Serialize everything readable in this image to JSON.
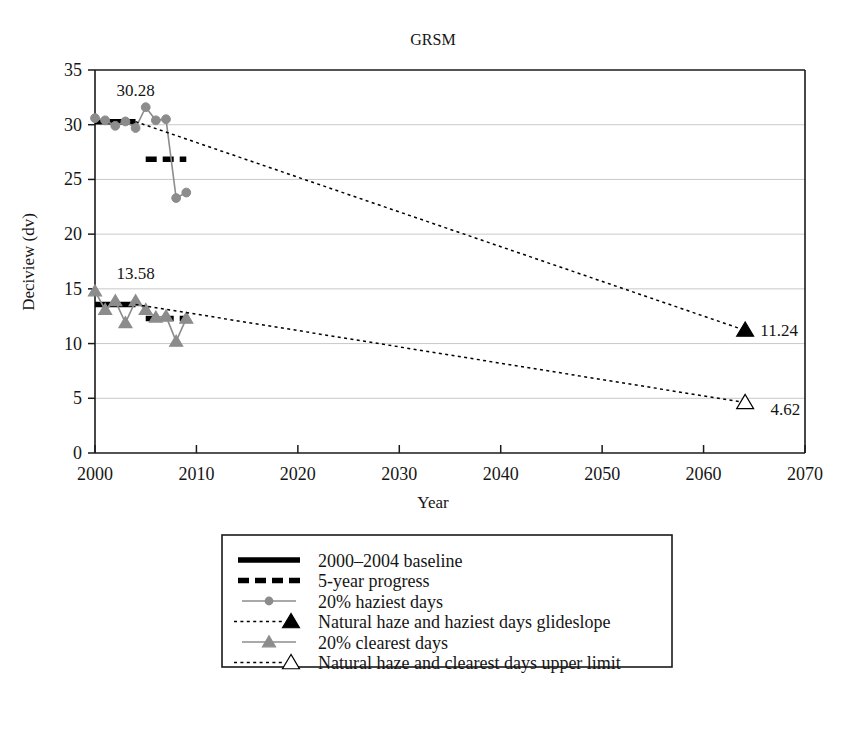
{
  "chart_data": {
    "type": "line",
    "title": "GRSM",
    "xlabel": "Year",
    "ylabel": "Deciview (dv)",
    "xlim": [
      2000,
      2070
    ],
    "ylim": [
      0,
      35
    ],
    "xticks": [
      "2000",
      "2010",
      "2020",
      "2030",
      "2040",
      "2050",
      "2060",
      "2070"
    ],
    "yticks": [
      "0",
      "5",
      "10",
      "15",
      "20",
      "25",
      "30",
      "35"
    ],
    "grid": "horizontal",
    "legend_position": "below-plot",
    "series": [
      {
        "name": "2000–2004 baseline",
        "style": "thick-solid-black",
        "color": "#000000",
        "x": [
          2000,
          2004
        ],
        "y": [
          30.28,
          30.28
        ],
        "label": "30.28"
      },
      {
        "name": "2000–2004 baseline (clearest)",
        "style": "thick-solid-black",
        "color": "#000000",
        "x": [
          2000,
          2004
        ],
        "y": [
          13.58,
          13.58
        ],
        "label": "13.58"
      },
      {
        "name": "5-year progress",
        "style": "thick-dashed-black",
        "color": "#000000",
        "x": [
          2005,
          2009
        ],
        "y": [
          26.85,
          26.85
        ]
      },
      {
        "name": "5-year progress (clearest)",
        "style": "thick-dashed-black",
        "color": "#000000",
        "x": [
          2005,
          2009
        ],
        "y": [
          12.3,
          12.3
        ]
      },
      {
        "name": "20% haziest days",
        "style": "line-circle-gray",
        "color": "#8c8c8c",
        "x": [
          2000,
          2001,
          2002,
          2003,
          2004,
          2005,
          2006,
          2007,
          2008,
          2009
        ],
        "y": [
          30.6,
          30.4,
          29.9,
          30.3,
          29.7,
          31.6,
          30.4,
          30.5,
          23.3,
          23.8
        ]
      },
      {
        "name": "Natural haze and haziest days glideslope",
        "style": "dotted-black-triangle-filled",
        "color": "#000000",
        "x": [
          2004,
          2064
        ],
        "y": [
          30.28,
          11.24
        ],
        "endpoint_label": "11.24",
        "marker": "filled-triangle"
      },
      {
        "name": "20% clearest days",
        "style": "line-triangle-gray",
        "color": "#8c8c8c",
        "x": [
          2000,
          2001,
          2002,
          2003,
          2004,
          2005,
          2006,
          2007,
          2008,
          2009
        ],
        "y": [
          14.8,
          13.1,
          13.9,
          11.9,
          13.9,
          13.1,
          12.4,
          12.5,
          10.2,
          12.3
        ]
      },
      {
        "name": "Natural haze and clearest days upper limit",
        "style": "dotted-black-triangle-open",
        "color": "#000000",
        "x": [
          2004,
          2064
        ],
        "y": [
          13.58,
          4.62
        ],
        "endpoint_label": "4.62",
        "marker": "open-triangle"
      }
    ],
    "annotations": [
      {
        "text": "30.28",
        "x": 2004,
        "y": 32.6
      },
      {
        "text": "13.58",
        "x": 2004,
        "y": 15.9
      },
      {
        "text": "11.24",
        "x": 2065,
        "y": 11.24
      },
      {
        "text": "4.62",
        "x": 2066,
        "y": 4.0
      }
    ]
  },
  "legend": {
    "items": [
      {
        "label": "2000–2004 baseline",
        "marker": "thick-solid-line",
        "color": "#000000"
      },
      {
        "label": "5-year progress",
        "marker": "thick-dashed-line",
        "color": "#000000"
      },
      {
        "label": "20% haziest days",
        "marker": "gray-line-circle",
        "color": "#8c8c8c"
      },
      {
        "label": "Natural haze and haziest days glideslope",
        "marker": "dotted-line-filled-triangle",
        "color": "#000000"
      },
      {
        "label": "20% clearest days",
        "marker": "gray-line-triangle",
        "color": "#8c8c8c"
      },
      {
        "label": "Natural haze and clearest days upper limit",
        "marker": "dotted-line-open-triangle",
        "color": "#000000"
      }
    ]
  },
  "colors": {
    "gray_series": "#8c8c8c",
    "black": "#000000",
    "gridline": "#c9c9c9",
    "axis": "#1a1a1a",
    "background": "#ffffff"
  }
}
